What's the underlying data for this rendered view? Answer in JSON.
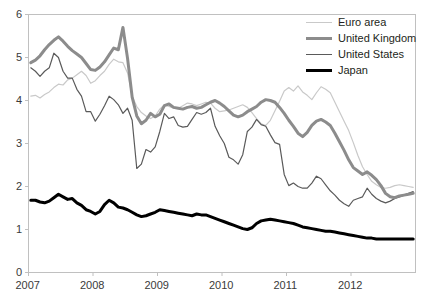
{
  "chart_data": {
    "type": "line",
    "title": "",
    "subtitle": "",
    "xlabel": "",
    "ylabel": "",
    "xlim": [
      2007.0,
      2013.0
    ],
    "ylim": [
      0,
      6
    ],
    "yticks": [
      0,
      1,
      2,
      3,
      4,
      5,
      6
    ],
    "ytick_labels": [
      "0",
      "1",
      "2",
      "3",
      "4",
      "5",
      "6"
    ],
    "xticks": [
      2007,
      2008,
      2009,
      2010,
      2011,
      2012
    ],
    "xtick_labels": [
      "2007",
      "2008",
      "2009",
      "2010",
      "2011",
      "2012"
    ],
    "grid": false,
    "legend_position": "top-right",
    "frame": true,
    "x_step_years": 0.08333333,
    "series": [
      {
        "name": "Euro area",
        "color": "#c9c9c9",
        "width": 1.2,
        "values": [
          4.1,
          4.12,
          4.06,
          4.14,
          4.2,
          4.3,
          4.38,
          4.36,
          4.48,
          4.52,
          4.6,
          4.68,
          4.58,
          4.4,
          4.46,
          4.58,
          4.68,
          4.84,
          4.96,
          4.9,
          4.88,
          4.64,
          4.1,
          3.86,
          3.72,
          3.64,
          3.58,
          3.64,
          3.8,
          3.9,
          3.86,
          3.82,
          3.82,
          3.88,
          3.94,
          3.92,
          3.88,
          3.92,
          3.96,
          3.94,
          3.82,
          3.74,
          3.76,
          3.78,
          3.82,
          3.86,
          3.9,
          3.84,
          3.72,
          3.58,
          3.46,
          3.42,
          3.54,
          3.76,
          3.98,
          4.22,
          4.3,
          4.22,
          4.34,
          4.2,
          4.12,
          4.02,
          4.18,
          4.32,
          4.26,
          4.18,
          3.96,
          3.74,
          3.52,
          3.3,
          3.02,
          2.72,
          2.46,
          2.28,
          2.12,
          2.04,
          1.98,
          1.96,
          1.98,
          2.02,
          2.04,
          2.02,
          2.0,
          1.98
        ],
        "y_start": 4.1,
        "y_end": 2.0,
        "min": 1.96,
        "max": 4.96
      },
      {
        "name": "United Kingdom",
        "color": "#8c8c8c",
        "width": 3.0,
        "values": [
          4.88,
          4.94,
          5.04,
          5.18,
          5.3,
          5.4,
          5.48,
          5.38,
          5.26,
          5.16,
          5.08,
          5.0,
          4.86,
          4.72,
          4.7,
          4.78,
          4.9,
          5.06,
          5.22,
          5.18,
          5.7,
          4.98,
          4.08,
          3.64,
          3.46,
          3.54,
          3.7,
          3.62,
          3.68,
          3.88,
          3.92,
          3.84,
          3.82,
          3.8,
          3.84,
          3.86,
          3.82,
          3.84,
          3.9,
          3.96,
          4.0,
          3.94,
          3.86,
          3.76,
          3.66,
          3.62,
          3.66,
          3.74,
          3.8,
          3.86,
          3.96,
          4.02,
          4.0,
          3.96,
          3.84,
          3.7,
          3.54,
          3.4,
          3.24,
          3.16,
          3.26,
          3.42,
          3.52,
          3.56,
          3.5,
          3.42,
          3.24,
          3.04,
          2.84,
          2.62,
          2.44,
          2.36,
          2.28,
          2.34,
          2.26,
          2.16,
          2.02,
          1.84,
          1.76,
          1.74,
          1.78,
          1.8,
          1.82,
          1.84
        ],
        "y_start": 4.88,
        "y_end": 1.84,
        "min": 1.74,
        "max": 5.7
      },
      {
        "name": "United States",
        "color": "#5a5a5a",
        "width": 1.2,
        "values": [
          4.76,
          4.68,
          4.56,
          4.68,
          4.76,
          5.1,
          5.0,
          4.68,
          4.52,
          4.52,
          4.26,
          4.1,
          3.74,
          3.74,
          3.52,
          3.68,
          3.88,
          4.1,
          4.02,
          3.9,
          3.7,
          3.82,
          3.54,
          2.42,
          2.52,
          2.86,
          2.8,
          2.92,
          3.28,
          3.7,
          3.58,
          3.62,
          3.42,
          3.38,
          3.4,
          3.56,
          3.72,
          3.68,
          3.72,
          3.82,
          3.4,
          3.18,
          3.0,
          2.68,
          2.62,
          2.52,
          2.74,
          3.28,
          3.38,
          3.56,
          3.44,
          3.4,
          3.2,
          3.02,
          2.98,
          2.28,
          2.02,
          2.08,
          2.0,
          1.96,
          1.96,
          2.08,
          2.24,
          2.18,
          2.04,
          1.9,
          1.8,
          1.68,
          1.6,
          1.54,
          1.68,
          1.72,
          1.76,
          1.96,
          1.82,
          1.72,
          1.66,
          1.62,
          1.66,
          1.72,
          1.76,
          1.8,
          1.84,
          1.88
        ],
        "y_start": 4.76,
        "y_end": 1.88,
        "min": 1.54,
        "max": 5.1
      },
      {
        "name": "Japan",
        "color": "#000000",
        "width": 3.0,
        "values": [
          1.68,
          1.68,
          1.64,
          1.62,
          1.66,
          1.74,
          1.82,
          1.76,
          1.7,
          1.72,
          1.62,
          1.56,
          1.46,
          1.42,
          1.36,
          1.42,
          1.58,
          1.68,
          1.62,
          1.52,
          1.5,
          1.46,
          1.4,
          1.34,
          1.3,
          1.32,
          1.36,
          1.4,
          1.46,
          1.44,
          1.42,
          1.4,
          1.38,
          1.36,
          1.34,
          1.32,
          1.36,
          1.34,
          1.34,
          1.3,
          1.26,
          1.22,
          1.18,
          1.14,
          1.1,
          1.06,
          1.02,
          1.0,
          1.04,
          1.14,
          1.2,
          1.22,
          1.24,
          1.22,
          1.2,
          1.18,
          1.16,
          1.14,
          1.1,
          1.06,
          1.04,
          1.02,
          1.0,
          0.98,
          0.96,
          0.96,
          0.94,
          0.92,
          0.9,
          0.88,
          0.86,
          0.84,
          0.82,
          0.8,
          0.8,
          0.78,
          0.78,
          0.78,
          0.78,
          0.78,
          0.78,
          0.78,
          0.78,
          0.78
        ],
        "y_start": 1.68,
        "y_end": 0.78,
        "min": 0.78,
        "max": 1.82
      }
    ]
  },
  "legend": {
    "items": [
      {
        "label": "Euro area"
      },
      {
        "label": "United Kingdom"
      },
      {
        "label": "United States"
      },
      {
        "label": "Japan"
      }
    ]
  },
  "axes": {
    "frame_color": "#c0c0c0",
    "tick_color": "#c0c0c0",
    "label_color": "#3a3a3a"
  }
}
